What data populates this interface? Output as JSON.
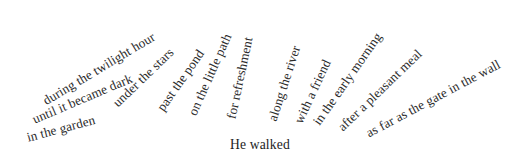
{
  "figure": {
    "type": "radial-phrase-fan",
    "anchor": {
      "text": "He walked",
      "x": 230,
      "y": 138
    },
    "text_color": "#2b2b2b",
    "background_color": "#ffffff",
    "spokes": [
      {
        "text": "in the garden",
        "x": 27,
        "y": 131,
        "angle": -15
      },
      {
        "text": "until it became dark",
        "x": 33,
        "y": 113,
        "angle": -23
      },
      {
        "text": "during the twilight hour",
        "x": 44,
        "y": 95,
        "angle": -31
      },
      {
        "text": "under the stars",
        "x": 115,
        "y": 98,
        "angle": -44
      },
      {
        "text": "past the pond",
        "x": 160,
        "y": 103,
        "angle": -55
      },
      {
        "text": "on the little path",
        "x": 192,
        "y": 108,
        "angle": -66
      },
      {
        "text": "for refreshment",
        "x": 231,
        "y": 112,
        "angle": -78
      },
      {
        "text": "along the river",
        "x": 272,
        "y": 114,
        "angle": -72
      },
      {
        "text": "with a friend",
        "x": 298,
        "y": 116,
        "angle": -65
      },
      {
        "text": "in the early morning",
        "x": 316,
        "y": 117,
        "angle": -55
      },
      {
        "text": "after a pleasant meal",
        "x": 340,
        "y": 122,
        "angle": -44
      },
      {
        "text": "as far as the gate in the wall",
        "x": 367,
        "y": 127,
        "angle": -28
      }
    ]
  }
}
